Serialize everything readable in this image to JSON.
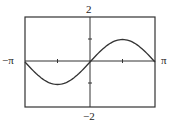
{
  "chart_data": {
    "type": "line",
    "title": "",
    "function": "y = sin(x)",
    "xlabel": "",
    "ylabel": "",
    "xlim": [
      -3.1416,
      3.1416
    ],
    "ylim": [
      -2,
      2
    ],
    "x_tick_labels": {
      "min": "−π",
      "max": "π"
    },
    "y_tick_labels": {
      "max": "2",
      "min": "−2"
    },
    "x_ticks": [
      -1.5708,
      1.5708
    ],
    "y_ticks": [
      -1,
      1
    ],
    "grid": false,
    "series": [
      {
        "name": "sin(x)",
        "x": [
          -3.1416,
          -2.3562,
          -1.5708,
          -0.7854,
          0,
          0.7854,
          1.5708,
          2.3562,
          3.1416
        ],
        "y": [
          0,
          -0.7071,
          -1,
          -0.7071,
          0,
          0.7071,
          1,
          0.7071,
          0
        ]
      }
    ]
  },
  "labels": {
    "x_min": "−π",
    "x_max": "π",
    "y_max": "2",
    "y_min": "−2"
  }
}
